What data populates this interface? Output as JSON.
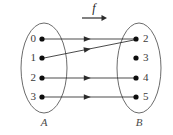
{
  "figure": {
    "type": "mapping-diagram",
    "title_symbol": "f",
    "background_color": "#ffffff",
    "stroke_color": "#2b2b2b",
    "ellipse_color": "#5a5a5a",
    "dot_color": "#0d0d0d",
    "label_color": "#3a3a3a"
  },
  "function_arrow": {
    "label": "f",
    "label_x": 94,
    "label_y": 9,
    "line_x1": 82,
    "line_x2": 103,
    "line_y": 18,
    "head_x": 107,
    "head_y": 18
  },
  "domain_set": {
    "name": "A",
    "label_x": 44,
    "label_y": 123,
    "ellipse": {
      "cx": 44,
      "cy": 68,
      "rx": 23,
      "ry": 45
    },
    "elements": [
      {
        "value": "0",
        "dot_x": 42,
        "dot_y": 39,
        "label_x": 36,
        "label_y": 39
      },
      {
        "value": "1",
        "dot_x": 42,
        "dot_y": 58,
        "label_x": 36,
        "label_y": 58
      },
      {
        "value": "2",
        "dot_x": 42,
        "dot_y": 78,
        "label_x": 36,
        "label_y": 78
      },
      {
        "value": "3",
        "dot_x": 42,
        "dot_y": 97,
        "label_x": 36,
        "label_y": 97
      }
    ]
  },
  "codomain_set": {
    "name": "B",
    "label_x": 139,
    "label_y": 123,
    "ellipse": {
      "cx": 139,
      "cy": 68,
      "rx": 22,
      "ry": 45
    },
    "elements": [
      {
        "value": "2",
        "dot_x": 136,
        "dot_y": 39,
        "label_x": 143,
        "label_y": 39
      },
      {
        "value": "3",
        "dot_x": 136,
        "dot_y": 58,
        "label_x": 143,
        "label_y": 58
      },
      {
        "value": "4",
        "dot_x": 136,
        "dot_y": 78,
        "label_x": 143,
        "label_y": 78
      },
      {
        "value": "5",
        "dot_x": 136,
        "dot_y": 97,
        "label_x": 143,
        "label_y": 97
      }
    ]
  },
  "mappings": [
    {
      "from": "0",
      "to": "2",
      "x1": 44,
      "y1": 39,
      "x2": 134,
      "y2": 39,
      "head_t": 0.52
    },
    {
      "from": "1",
      "to": "2",
      "x1": 44,
      "y1": 58,
      "x2": 134,
      "y2": 40,
      "head_t": 0.52
    },
    {
      "from": "2",
      "to": "4",
      "x1": 44,
      "y1": 78,
      "x2": 134,
      "y2": 78,
      "head_t": 0.52
    },
    {
      "from": "3",
      "to": "5",
      "x1": 44,
      "y1": 97,
      "x2": 134,
      "y2": 97,
      "head_t": 0.52
    }
  ],
  "dot_radius": 2.6
}
